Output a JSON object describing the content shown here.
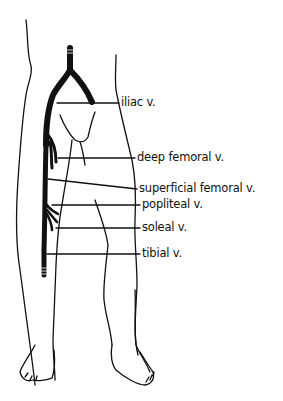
{
  "figure": {
    "colors": {
      "ink": "#111111",
      "background": "#ffffff"
    },
    "labels": [
      {
        "id": "iliac",
        "text": "iliac v.",
        "x": 119,
        "y": 97
      },
      {
        "id": "deep-femoral",
        "text": "deep femoral v.",
        "x": 135,
        "y": 152
      },
      {
        "id": "superficial-femoral",
        "text": "superficial femoral v.",
        "x": 138,
        "y": 184
      },
      {
        "id": "popliteal",
        "text": "popliteal v.",
        "x": 141,
        "y": 203
      },
      {
        "id": "soleal",
        "text": "soleal v.",
        "x": 141,
        "y": 223
      },
      {
        "id": "tibial",
        "text": "tibial v.",
        "x": 141,
        "y": 249
      }
    ]
  }
}
